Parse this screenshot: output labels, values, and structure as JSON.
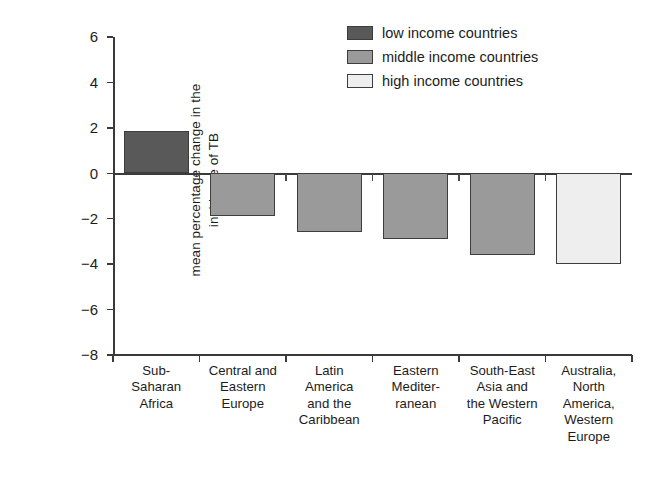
{
  "chart_data": {
    "type": "bar",
    "title": "",
    "xlabel": "",
    "ylabel": "mean percentage change in the incidence of TB",
    "ylabel_line1": "mean percentage change in the",
    "ylabel_line2": "incidence of TB",
    "ylim": [
      -8,
      6
    ],
    "ytick_values": [
      6,
      4,
      2,
      0,
      -2,
      -4,
      -6,
      -8
    ],
    "ytick_labels": [
      "6",
      "4",
      "2",
      "0",
      "−2",
      "−4",
      "−6",
      "−8"
    ],
    "grid": false,
    "legend_position": "top-right",
    "categories": [
      "Sub-Saharan Africa",
      "Central and Eastern Europe",
      "Latin America and the Caribbean",
      "Eastern Mediterranean",
      "South-East Asia and the Western Pacific",
      "Australia, North America, Western Europe"
    ],
    "category_label_lines": [
      [
        "Sub-",
        "Saharan",
        "Africa"
      ],
      [
        "Central and",
        "Eastern",
        "Europe"
      ],
      [
        "Latin",
        "America",
        "and the",
        "Caribbean"
      ],
      [
        "Eastern",
        "Mediter-",
        "ranean"
      ],
      [
        "South-East",
        "Asia and",
        "the Western",
        "Pacific"
      ],
      [
        "Australia,",
        "North",
        "America,",
        "Western",
        "Europe"
      ]
    ],
    "values": [
      1.85,
      -1.9,
      -2.6,
      -2.9,
      -3.6,
      -4.0
    ],
    "groups": [
      "low income countries",
      "middle income countries",
      "middle income countries",
      "middle income countries",
      "middle income countries",
      "high income countries"
    ]
  },
  "legend": {
    "items": [
      {
        "label": "low income countries",
        "color": "#595959"
      },
      {
        "label": "middle income countries",
        "color": "#9a9a9a"
      },
      {
        "label": "high income countries",
        "color": "#eeeeee"
      }
    ]
  },
  "colors": {
    "low_income": "#595959",
    "middle_income": "#9a9a9a",
    "high_income": "#eeeeee",
    "axis": "#3a3a3a",
    "text": "#1c1c1c",
    "background": "#ffffff"
  }
}
